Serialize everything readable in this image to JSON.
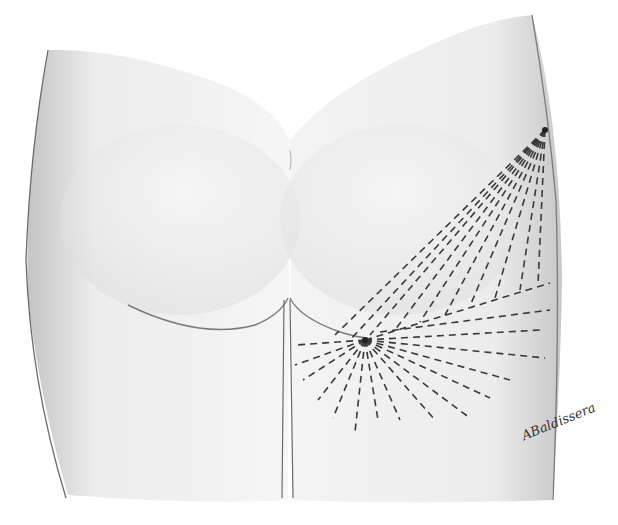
{
  "illustration": {
    "subject": "posterior view of buttocks and upper thighs",
    "colors": {
      "skin_light": "#f4f4f4",
      "skin_shadow": "#c9c9c9",
      "outline": "#6a6a6a",
      "dash_lines": "#3a3a3a",
      "background": "#ffffff"
    },
    "radiating_points": [
      {
        "name": "lateral-hip-point",
        "x": 545,
        "y": 130
      },
      {
        "name": "gluteal-fold-point",
        "x": 365,
        "y": 340
      }
    ]
  },
  "signature": {
    "text": "ABaldissera"
  }
}
